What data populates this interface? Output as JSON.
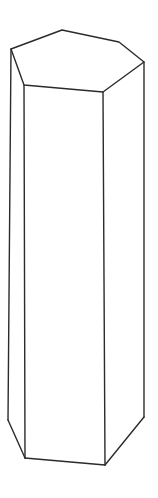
{
  "figure": {
    "name": "hexagonal-prism",
    "render_style": "wireframe-outline",
    "canvas": {
      "width": 158,
      "height": 498,
      "background_color": "#ffffff"
    },
    "stroke": {
      "color": "#2b2b2b",
      "width": 1.4,
      "fill_color": "#ffffff"
    },
    "geometry": {
      "top_face": {
        "label": "top-hexagon",
        "sides": 6,
        "points": "11,49 62,30 119,42 144,62 103,92 24,85"
      },
      "left_face": {
        "label": "front-left-quad",
        "points": "11,49 24,85 25,458 8,420"
      },
      "front_face": {
        "label": "front-center-quad",
        "points": "24,85 103,92 105,465 25,458"
      },
      "right_face": {
        "label": "front-right-quad",
        "points": "103,92 144,62 144,417 105,465"
      },
      "vertices": {
        "top_left_back": "11,49",
        "top_top_left": "62,30",
        "top_top_right": "119,42",
        "top_right_back": "144,62",
        "top_front_right": "103,92",
        "top_front_left": "24,85",
        "bottom_left_back": "8,420",
        "bottom_front_left": "25,458",
        "bottom_front_right": "105,465",
        "bottom_right_back": "144,417"
      },
      "edges": {
        "top_back_left": "11,49 62,30",
        "top_back_right": "62,30 119,42",
        "top_right_upper": "119,42 144,62",
        "top_right_lower": "144,62 103,92",
        "top_front": "103,92 24,85",
        "top_left_lower": "24,85 11,49",
        "vertical_left_back": "11,49 8,420",
        "vertical_front_left": "24,85 25,458",
        "vertical_front_right": "103,92 105,465",
        "vertical_right_back": "144,62 144,417",
        "bottom_left": "8,420 25,458",
        "bottom_front": "25,458 105,465",
        "bottom_right": "105,465 144,417"
      }
    }
  }
}
